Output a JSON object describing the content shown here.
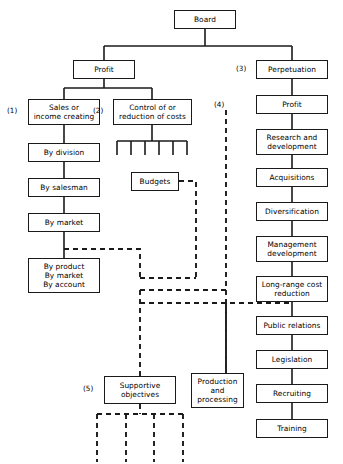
{
  "diagram": {
    "colors": {
      "line": "#1a1a1a",
      "box_border": "#1a1a1a",
      "background": "#ffffff",
      "text": "#000000"
    },
    "nodes": [
      {
        "id": "board",
        "label": "Board",
        "x": 174,
        "y": 10,
        "w": 62,
        "h": 19
      },
      {
        "id": "profit",
        "label": "Profit",
        "x": 73,
        "y": 60,
        "w": 62,
        "h": 19
      },
      {
        "id": "perpetuation",
        "label": "Perpetuation",
        "x": 256,
        "y": 60,
        "w": 72,
        "h": 19
      },
      {
        "id": "sales",
        "label": "Sales or\nincome creating",
        "x": 28,
        "y": 99,
        "w": 72,
        "h": 26
      },
      {
        "id": "control",
        "label": "Control of or\nreduction of costs",
        "x": 113,
        "y": 99,
        "w": 79,
        "h": 26
      },
      {
        "id": "profit2",
        "label": "Profit",
        "x": 256,
        "y": 95,
        "w": 72,
        "h": 19
      },
      {
        "id": "by-division",
        "label": "By division",
        "x": 28,
        "y": 143,
        "w": 72,
        "h": 19
      },
      {
        "id": "research",
        "label": "Research and\ndevelopment",
        "x": 256,
        "y": 129,
        "w": 72,
        "h": 26
      },
      {
        "id": "budgets",
        "label": "Budgets",
        "x": 131,
        "y": 172,
        "w": 48,
        "h": 19
      },
      {
        "id": "by-salesman",
        "label": "By salesman",
        "x": 28,
        "y": 178,
        "w": 72,
        "h": 19
      },
      {
        "id": "acquisitions",
        "label": "Acquisitions",
        "x": 256,
        "y": 168,
        "w": 72,
        "h": 19
      },
      {
        "id": "by-market",
        "label": "By market",
        "x": 28,
        "y": 213,
        "w": 72,
        "h": 19
      },
      {
        "id": "diversification",
        "label": "Diversification",
        "x": 256,
        "y": 202,
        "w": 72,
        "h": 19
      },
      {
        "id": "mgmt-dev",
        "label": "Management\ndevelopment",
        "x": 256,
        "y": 236,
        "w": 72,
        "h": 26
      },
      {
        "id": "by-product",
        "label": "By product\nBy market\nBy account",
        "x": 28,
        "y": 258,
        "w": 72,
        "h": 35
      },
      {
        "id": "long-range",
        "label": "Long-range cost\nreduction",
        "x": 256,
        "y": 276,
        "w": 72,
        "h": 26
      },
      {
        "id": "public-rel",
        "label": "Public relations",
        "x": 256,
        "y": 316,
        "w": 72,
        "h": 19
      },
      {
        "id": "legislation",
        "label": "Legislation",
        "x": 256,
        "y": 350,
        "w": 72,
        "h": 19
      },
      {
        "id": "supportive",
        "label": "Supportive\nobjectives",
        "x": 104,
        "y": 376,
        "w": 72,
        "h": 28
      },
      {
        "id": "production",
        "label": "Production\nand\nprocessing",
        "x": 191,
        "y": 373,
        "w": 53,
        "h": 35
      },
      {
        "id": "recruiting",
        "label": "Recruiting",
        "x": 256,
        "y": 384,
        "w": 72,
        "h": 19
      },
      {
        "id": "training",
        "label": "Training",
        "x": 256,
        "y": 419,
        "w": 72,
        "h": 19
      }
    ],
    "tags": [
      {
        "id": "tag-1",
        "label": "(1)",
        "x": 7,
        "y": 107
      },
      {
        "id": "tag-2",
        "label": "(2)",
        "x": 93,
        "y": 107
      },
      {
        "id": "tag-3",
        "label": "(3)",
        "x": 236,
        "y": 65
      },
      {
        "id": "tag-4",
        "label": "(4)",
        "x": 214,
        "y": 101
      },
      {
        "id": "tag-5",
        "label": "(5)",
        "x": 83,
        "y": 385
      }
    ],
    "solid_edges": [
      {
        "id": "board-stem",
        "d": "M205,29 L205,46"
      },
      {
        "id": "board-bus",
        "d": "M104,46 L292,46"
      },
      {
        "id": "profit-drop",
        "d": "M104,46 L104,60"
      },
      {
        "id": "perpetuation-drop",
        "d": "M292,46 L292,60"
      },
      {
        "id": "profit-stem",
        "d": "M104,79 L104,88"
      },
      {
        "id": "profit-bus",
        "d": "M64,88 L152,88"
      },
      {
        "id": "sales-drop",
        "d": "M64,88 L64,99"
      },
      {
        "id": "control-drop",
        "d": "M152,88 L152,99"
      },
      {
        "id": "sales-to-division",
        "d": "M64,125 L64,143"
      },
      {
        "id": "division-salesman",
        "d": "M64,162 L64,178"
      },
      {
        "id": "salesman-market",
        "d": "M64,197 L64,213"
      },
      {
        "id": "market-product",
        "d": "M64,232 L64,258"
      },
      {
        "id": "control-comb-stem",
        "d": "M152,125 L152,141"
      },
      {
        "id": "control-comb-bar",
        "d": "M117,141 L187,141"
      },
      {
        "id": "comb-prong-1",
        "d": "M117,141 L117,155"
      },
      {
        "id": "comb-prong-2",
        "d": "M131,141 L131,155"
      },
      {
        "id": "comb-prong-3",
        "d": "M145,141 L145,155"
      },
      {
        "id": "comb-prong-4",
        "d": "M159,141 L159,155"
      },
      {
        "id": "comb-prong-5",
        "d": "M173,141 L173,155"
      },
      {
        "id": "comb-prong-6",
        "d": "M187,141 L187,155"
      },
      {
        "id": "perp-profit",
        "d": "M292,79 L292,95"
      },
      {
        "id": "profit-research",
        "d": "M292,114 L292,129"
      },
      {
        "id": "research-acq",
        "d": "M292,155 L292,168"
      },
      {
        "id": "acq-div",
        "d": "M292,187 L292,202"
      },
      {
        "id": "div-mgmt",
        "d": "M292,221 L292,236"
      },
      {
        "id": "mgmt-longrange",
        "d": "M292,262 L292,276"
      },
      {
        "id": "longrange-pr",
        "d": "M292,302 L292,316"
      },
      {
        "id": "pr-legislation",
        "d": "M292,335 L292,350"
      },
      {
        "id": "legislation-recr",
        "d": "M292,369 L292,384"
      },
      {
        "id": "recr-training",
        "d": "M292,403 L292,419"
      }
    ],
    "dashed_edges": [
      {
        "id": "four-vertical",
        "d": "M226,110 L226,373"
      },
      {
        "id": "market-branch-out",
        "d": "M64,249 L140,249 L140,278"
      },
      {
        "id": "budgets-out",
        "d": "M179,181 L196,181 L196,278"
      },
      {
        "id": "budgets-join",
        "d": "M140,278 L196,278"
      },
      {
        "id": "mid-bus-upper",
        "d": "M140,290 L226,290"
      },
      {
        "id": "mid-bus-lower",
        "d": "M140,303 L292,303"
      },
      {
        "id": "supportive-feed",
        "d": "M140,290 L140,376"
      },
      {
        "id": "production-feed",
        "d": "M226,303 L226,373"
      },
      {
        "id": "supportive-comb-stem",
        "d": "M140,404 L140,414"
      },
      {
        "id": "supportive-comb-bar",
        "d": "M97,414 L183,414"
      },
      {
        "id": "sub-prong-1",
        "d": "M97,414 L97,462"
      },
      {
        "id": "sub-prong-2",
        "d": "M126,414 L126,462"
      },
      {
        "id": "sub-prong-3",
        "d": "M154,414 L154,462"
      },
      {
        "id": "sub-prong-4",
        "d": "M183,414 L183,462"
      }
    ]
  }
}
